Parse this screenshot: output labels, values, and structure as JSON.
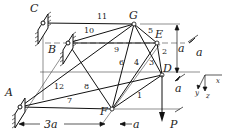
{
  "diagram": {
    "points": {
      "A": {
        "label": "A",
        "x": 20,
        "y": 107
      },
      "B": {
        "label": "B",
        "x": 68,
        "y": 43
      },
      "C": {
        "label": "C",
        "x": 43,
        "y": 23
      },
      "D": {
        "label": "D",
        "x": 162,
        "y": 75
      },
      "E": {
        "label": "E",
        "x": 157,
        "y": 43
      },
      "F": {
        "label": "F",
        "x": 112,
        "y": 109
      },
      "G": {
        "label": "G",
        "x": 134,
        "y": 24
      }
    },
    "members": [
      {
        "id": "1",
        "label": "1"
      },
      {
        "id": "2",
        "label": "2"
      },
      {
        "id": "3",
        "label": "3"
      },
      {
        "id": "4",
        "label": "4"
      },
      {
        "id": "5",
        "label": "5"
      },
      {
        "id": "6",
        "label": "6"
      },
      {
        "id": "7",
        "label": "7"
      },
      {
        "id": "8",
        "label": "8"
      },
      {
        "id": "9",
        "label": "9"
      },
      {
        "id": "10",
        "label": "10"
      },
      {
        "id": "11",
        "label": "11"
      },
      {
        "id": "12",
        "label": "12"
      }
    ],
    "load": {
      "label": "P"
    },
    "dimensions": {
      "horizontal_AF": "3a",
      "horizontal_F": "a",
      "vertical_GD": "a",
      "depth_top": "a",
      "depth_bottom": "a"
    },
    "axes": {
      "x": "x",
      "y": "y",
      "z": "z"
    }
  }
}
